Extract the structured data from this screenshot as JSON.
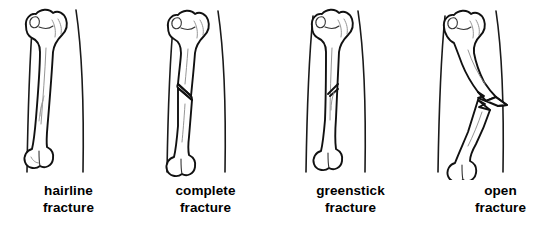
{
  "figure": {
    "background_color": "#ffffff",
    "ink_color": "#111111",
    "caption_color": "#000000",
    "panel_count": 4
  },
  "panels": [
    {
      "id": "hairline-fracture",
      "caption_line1": "hairline",
      "caption_line2": "fracture",
      "bone": "femur",
      "fracture_description": "thin incomplete crack running along the shaft without separation",
      "crack_style": "hairline",
      "displacement": "none",
      "skin_broken": false
    },
    {
      "id": "complete-fracture",
      "caption_line1": "complete",
      "caption_line2": "fracture",
      "bone": "femur",
      "fracture_description": "long oblique break passing fully through the shaft with the fragments offset",
      "crack_style": "oblique-through",
      "displacement": "offset",
      "skin_broken": false
    },
    {
      "id": "greenstick-fracture",
      "caption_line1": "greenstick",
      "caption_line2": "fracture",
      "bone": "femur",
      "fracture_description": "partial break entering from one side and stopping part way across the shaft",
      "crack_style": "partial",
      "displacement": "bent",
      "skin_broken": false
    },
    {
      "id": "open-fracture",
      "caption_line1": "open",
      "caption_line2": "fracture",
      "bone": "femur",
      "fracture_description": "jagged break with a sharp bone fragment piercing through the skin outline",
      "crack_style": "jagged-through",
      "displacement": "protruding",
      "skin_broken": true
    }
  ]
}
